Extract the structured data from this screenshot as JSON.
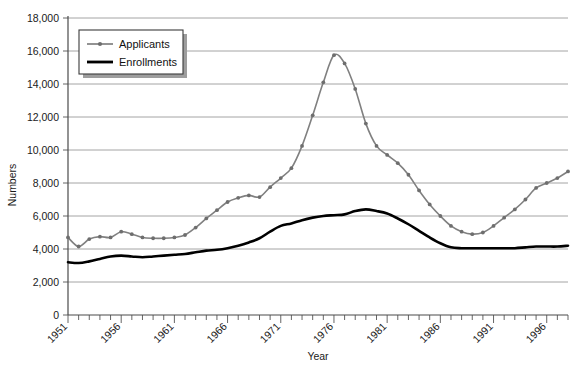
{
  "chart_data": {
    "type": "line",
    "title": "",
    "xlabel": "Year",
    "ylabel": "Numbers",
    "ylim": [
      0,
      18000
    ],
    "ytick_step": 2000,
    "ytick_labels": [
      "0",
      "2,000",
      "4,000",
      "6,000",
      "8,000",
      "10,000",
      "12,000",
      "14,000",
      "16,000",
      "18,000"
    ],
    "ytick_values": [
      0,
      2000,
      4000,
      6000,
      8000,
      10000,
      12000,
      14000,
      16000,
      18000
    ],
    "xlim": [
      1951,
      1998
    ],
    "xtick_labels": [
      "1951",
      "1956",
      "1961",
      "1966",
      "1971",
      "1976",
      "1981",
      "1986",
      "1991",
      "1996"
    ],
    "xtick_values": [
      1951,
      1956,
      1961,
      1966,
      1971,
      1976,
      1981,
      1986,
      1991,
      1996
    ],
    "grid": "horizontal",
    "legend_position": "top-left",
    "x": [
      1951,
      1952,
      1953,
      1954,
      1955,
      1956,
      1957,
      1958,
      1959,
      1960,
      1961,
      1962,
      1963,
      1964,
      1965,
      1966,
      1967,
      1968,
      1969,
      1970,
      1971,
      1972,
      1973,
      1974,
      1975,
      1976,
      1977,
      1978,
      1979,
      1980,
      1981,
      1982,
      1983,
      1984,
      1985,
      1986,
      1987,
      1988,
      1989,
      1990,
      1991,
      1992,
      1993,
      1994,
      1995,
      1996,
      1997,
      1998
    ],
    "series": [
      {
        "name": "Applicants",
        "color": "#808080",
        "markers": true,
        "values": [
          4700,
          4150,
          4600,
          4750,
          4700,
          5050,
          4900,
          4700,
          4650,
          4650,
          4700,
          4850,
          5300,
          5850,
          6350,
          6850,
          7100,
          7250,
          7150,
          7750,
          8300,
          8900,
          10250,
          12100,
          14100,
          15750,
          15250,
          13700,
          11600,
          10250,
          9700,
          9200,
          8500,
          7550,
          6700,
          6000,
          5400,
          5050,
          4900,
          5000,
          5400,
          5900,
          6400,
          7000,
          7700,
          8000,
          8300,
          8700
        ]
      },
      {
        "name": "Enrollments",
        "color": "#000000",
        "markers": false,
        "values": [
          3200,
          3150,
          3250,
          3400,
          3550,
          3600,
          3550,
          3500,
          3550,
          3600,
          3650,
          3700,
          3800,
          3900,
          3950,
          4050,
          4200,
          4400,
          4650,
          5050,
          5400,
          5550,
          5750,
          5900,
          6000,
          6050,
          6100,
          6300,
          6400,
          6300,
          6150,
          5850,
          5500,
          5100,
          4700,
          4350,
          4100,
          4050,
          4050,
          4050,
          4050,
          4050,
          4050,
          4100,
          4150,
          4150,
          4150,
          4200
        ]
      }
    ]
  },
  "legend": {
    "items": [
      {
        "label": "Applicants",
        "color": "#808080"
      },
      {
        "label": "Enrollments",
        "color": "#000000"
      }
    ]
  }
}
